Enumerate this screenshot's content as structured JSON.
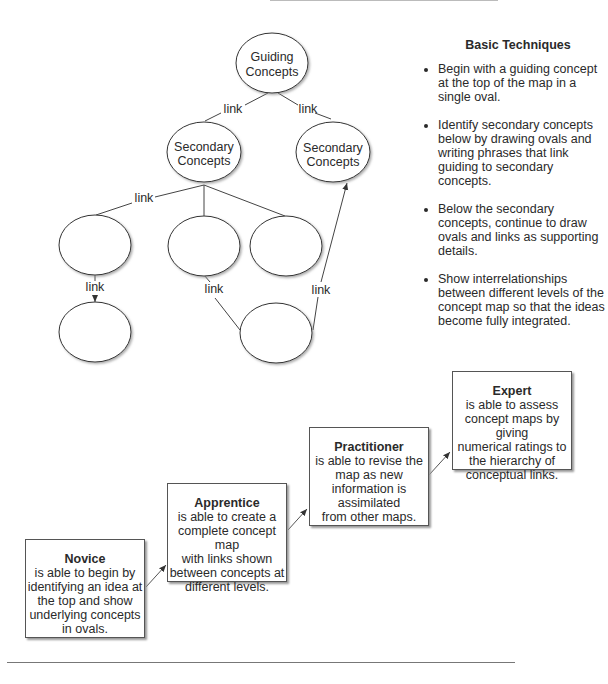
{
  "concept_map": {
    "guiding": {
      "line1": "Guiding",
      "line2": "Concepts"
    },
    "secondary_left": {
      "line1": "Secondary",
      "line2": "Concepts"
    },
    "secondary_right": {
      "line1": "Secondary",
      "line2": "Concepts"
    },
    "link_label": "link",
    "links": [
      "link",
      "link",
      "link",
      "link",
      "link",
      "link"
    ]
  },
  "basic_techniques": {
    "title": "Basic Techniques",
    "items": [
      "Begin with a guiding concept at the top of the map in a single oval.",
      "Identify secondary concepts below by drawing ovals and writing phrases that link guiding to secondary concepts.",
      "Below the secondary concepts, continue to draw ovals and links as supporting details.",
      "Show interrelationships between different levels of the concept map so that the ideas become fully integrated."
    ]
  },
  "progression": [
    {
      "title": "Novice",
      "lines": [
        "is able to begin by",
        "identifying an idea at",
        "the top and show",
        "underlying concepts",
        "in ovals."
      ]
    },
    {
      "title": "Apprentice",
      "lines": [
        "is able to create a",
        "complete concept map",
        "with links shown",
        "between concepts at",
        "different levels."
      ]
    },
    {
      "title": "Practitioner",
      "lines": [
        "is able to revise the",
        "map as new",
        "information is",
        "assimilated",
        "from other maps."
      ]
    },
    {
      "title": "Expert",
      "lines": [
        "is able to assess",
        "concept maps by giving",
        "numerical ratings to",
        "the hierarchy of",
        "conceptual links."
      ]
    }
  ]
}
